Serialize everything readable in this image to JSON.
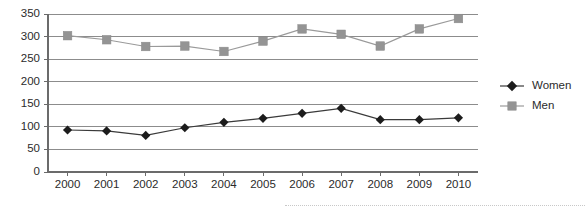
{
  "chart_data": {
    "type": "line",
    "title": "",
    "xlabel": "",
    "ylabel": "",
    "categories": [
      "2000",
      "2001",
      "2002",
      "2003",
      "2004",
      "2005",
      "2006",
      "2007",
      "2008",
      "2009",
      "2010"
    ],
    "series": [
      {
        "name": "Women",
        "marker": "diamond",
        "color": "#1c1c1c",
        "line_color": "#3a3a3a",
        "values": [
          93,
          91,
          81,
          98,
          110,
          119,
          130,
          141,
          116,
          116,
          120
        ]
      },
      {
        "name": "Men",
        "marker": "square",
        "color": "#949494",
        "line_color": "#9a9a9a",
        "values": [
          302,
          293,
          278,
          279,
          267,
          290,
          317,
          305,
          279,
          317,
          340
        ]
      }
    ],
    "ylim": [
      0,
      350
    ],
    "yticks": [
      0,
      50,
      100,
      150,
      200,
      250,
      300,
      350
    ],
    "ytick_labels": [
      "0",
      "50",
      "100",
      "150",
      "200",
      "250",
      "300",
      "350"
    ],
    "grid": true,
    "grid_axis": "y",
    "legend_position": "right",
    "legend_entries": [
      "Women",
      "Men"
    ]
  },
  "legend": {
    "women_label": "Women",
    "men_label": "Men"
  }
}
